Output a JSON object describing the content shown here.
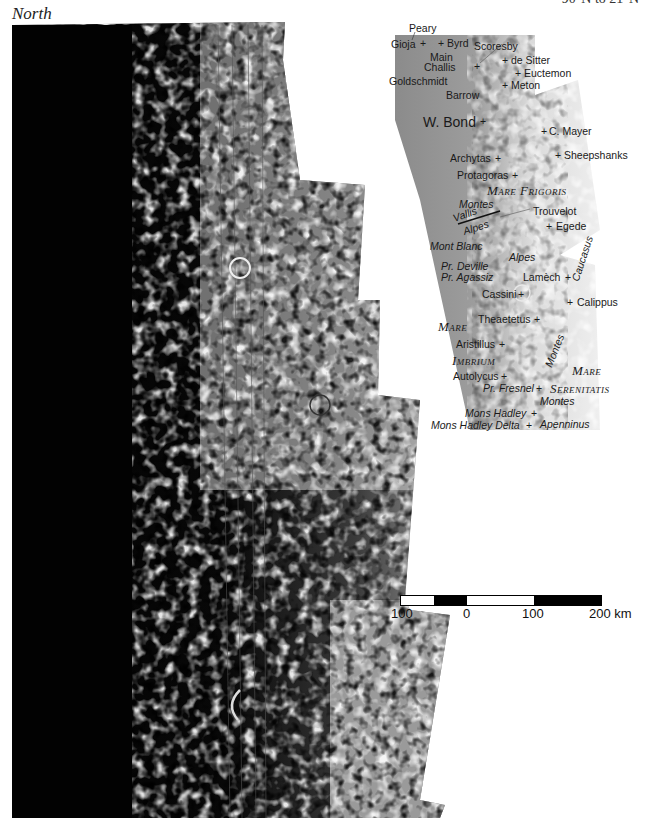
{
  "header": {
    "orientation": "North",
    "latitude_range": "90°N to 21°N"
  },
  "map": {
    "title": "Lunar terminator mosaic, north polar region to Mare Serenitatis",
    "colors": {
      "shadow": "#050505",
      "highland": "#d8d8d8",
      "mare": "#a8a8a8",
      "inset_base": "#8c8c8c",
      "background": "#ffffff"
    },
    "inset_labels": {
      "craters": [
        {
          "name": "Peary"
        },
        {
          "name": "Gioja"
        },
        {
          "name": "Byrd"
        },
        {
          "name": "Scoresby"
        },
        {
          "name": "Main"
        },
        {
          "name": "Challis"
        },
        {
          "name": "de Sitter"
        },
        {
          "name": "Euctemon"
        },
        {
          "name": "Goldschmidt"
        },
        {
          "name": "Meton"
        },
        {
          "name": "Barrow"
        },
        {
          "name": "W. Bond"
        },
        {
          "name": "C. Mayer"
        },
        {
          "name": "Archytas"
        },
        {
          "name": "Sheepshanks"
        },
        {
          "name": "Protagoras"
        },
        {
          "name": "Trouvelot"
        },
        {
          "name": "Egede"
        },
        {
          "name": "Lamèch"
        },
        {
          "name": "Cassini"
        },
        {
          "name": "Calippus"
        },
        {
          "name": "Theaetetus"
        },
        {
          "name": "Aristillus"
        },
        {
          "name": "Autolycus"
        }
      ],
      "features": [
        {
          "name": "Montes"
        },
        {
          "name": "Vallis"
        },
        {
          "name": "Alpes"
        },
        {
          "name": "Mont Blanc"
        },
        {
          "name": "Alpes"
        },
        {
          "name": "Pr. Deville"
        },
        {
          "name": "Pr. Agassiz"
        },
        {
          "name": "Caucasus"
        },
        {
          "name": "Montes"
        },
        {
          "name": "Pr. Fresnel"
        },
        {
          "name": "Montes"
        },
        {
          "name": "Mons Hadley"
        },
        {
          "name": "Mons Hadley Delta"
        },
        {
          "name": "Apenninus"
        }
      ],
      "maria": [
        {
          "name": "Mare Frigoris"
        },
        {
          "name": "Mare"
        },
        {
          "name": "Imbrium"
        },
        {
          "name": "Mare"
        },
        {
          "name": "Serenitatis"
        }
      ]
    },
    "scale_bar": {
      "ticks": [
        "100",
        "0",
        "100",
        "200 km"
      ],
      "segments": [
        "white",
        "black",
        "white",
        "black"
      ]
    }
  }
}
